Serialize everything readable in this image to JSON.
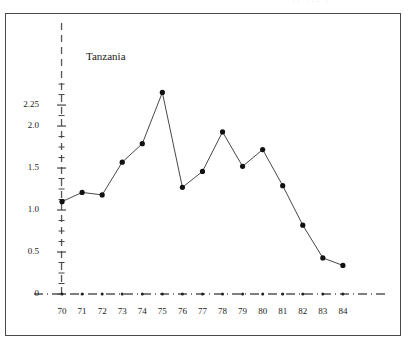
{
  "figure": {
    "background_color": "#ffffff",
    "frame_color": "#4a4a4a",
    "top_artifact_text": "··  ··· ·"
  },
  "chart_data": {
    "type": "line",
    "title": "",
    "subtitle": "",
    "xlabel": "",
    "ylabel": "",
    "annotation": "Tanzania",
    "series_name": "Tanzania",
    "x": [
      70,
      71,
      72,
      73,
      74,
      75,
      76,
      77,
      78,
      79,
      80,
      81,
      82,
      83,
      84
    ],
    "x_tick_labels": [
      "70",
      "71",
      "72",
      "73",
      "74",
      "75",
      "76",
      "77",
      "78",
      "79",
      "80",
      "81",
      "82",
      "83",
      "84"
    ],
    "values": [
      1.1,
      1.21,
      1.18,
      1.57,
      1.79,
      2.4,
      1.27,
      1.46,
      1.93,
      1.52,
      1.72,
      1.29,
      0.82,
      0.43,
      0.34
    ],
    "y_tick_labels": [
      "0",
      "0.5",
      "1.0",
      "1.5",
      "2.0",
      "2.25"
    ],
    "y_tick_values": [
      0,
      0.5,
      1.0,
      1.5,
      2.0,
      2.25
    ],
    "y_minor_step": 0.125,
    "xlim": [
      69.3,
      85.6
    ],
    "ylim": [
      0,
      2.62
    ],
    "grid": false,
    "legend": "none",
    "marker": "filled-circle",
    "marker_color": "#111111",
    "line_color": "#333333",
    "axis_style": "dashed",
    "axis_color": "#555555"
  }
}
